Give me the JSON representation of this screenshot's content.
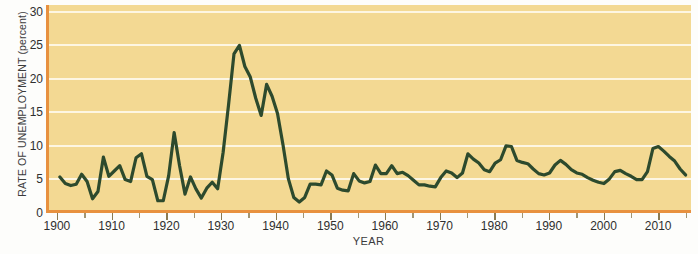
{
  "chart_data": {
    "type": "line",
    "title": "",
    "xlabel": "YEAR",
    "ylabel": "RATE OF UNEMPLOYMENT (percent)",
    "xlim": [
      1898,
      2016
    ],
    "ylim": [
      0,
      31
    ],
    "grid": "horizontal",
    "legend": "none",
    "line_color": "#2d4a2d",
    "plot_background": "#f3d993",
    "axis_color": "#e8913f",
    "gridline_color": "#fdf6e2",
    "y_ticks": [
      0,
      5,
      10,
      15,
      20,
      25,
      30
    ],
    "y_tick_labels": [
      "0",
      "5",
      "10",
      "15",
      "20",
      "25",
      "30"
    ],
    "x_ticks": [
      1900,
      1910,
      1920,
      1930,
      1940,
      1950,
      1960,
      1970,
      1980,
      1990,
      2000,
      2010
    ],
    "x_tick_labels": [
      "1900",
      "1910",
      "1920",
      "1930",
      "1940",
      "1950",
      "1960",
      "1970",
      "1980",
      "1990",
      "2000",
      "2010"
    ],
    "x_minor_ticks": [
      1905,
      1915,
      1925,
      1935,
      1945,
      1955,
      1965,
      1975,
      1985,
      1995,
      2005,
      2015
    ],
    "x": [
      1900,
      1901,
      1902,
      1903,
      1904,
      1905,
      1906,
      1907,
      1908,
      1909,
      1910,
      1911,
      1912,
      1913,
      1914,
      1915,
      1916,
      1917,
      1918,
      1919,
      1920,
      1921,
      1922,
      1923,
      1924,
      1925,
      1926,
      1927,
      1928,
      1929,
      1930,
      1931,
      1932,
      1933,
      1934,
      1935,
      1936,
      1937,
      1938,
      1939,
      1940,
      1941,
      1942,
      1943,
      1944,
      1945,
      1946,
      1947,
      1948,
      1949,
      1950,
      1951,
      1952,
      1953,
      1954,
      1955,
      1956,
      1957,
      1958,
      1959,
      1960,
      1961,
      1962,
      1963,
      1964,
      1965,
      1966,
      1967,
      1968,
      1969,
      1970,
      1971,
      1972,
      1973,
      1974,
      1975,
      1976,
      1977,
      1978,
      1979,
      1980,
      1981,
      1982,
      1983,
      1984,
      1985,
      1986,
      1987,
      1988,
      1989,
      1990,
      1991,
      1992,
      1993,
      1994,
      1995,
      1996,
      1997,
      1998,
      1999,
      2000,
      2001,
      2002,
      2003,
      2004,
      2005,
      2006,
      2007,
      2008,
      2009,
      2010,
      2011,
      2012,
      2013,
      2014,
      2015
    ],
    "values": [
      5.0,
      4.0,
      3.7,
      3.9,
      5.4,
      4.3,
      1.7,
      2.8,
      8.0,
      5.1,
      5.9,
      6.7,
      4.6,
      4.3,
      7.9,
      8.5,
      5.1,
      4.6,
      1.4,
      1.4,
      5.2,
      11.7,
      6.7,
      2.4,
      5.0,
      3.2,
      1.8,
      3.3,
      4.2,
      3.2,
      8.7,
      15.9,
      23.6,
      24.9,
      21.7,
      20.1,
      16.9,
      14.3,
      19.0,
      17.2,
      14.6,
      9.9,
      4.7,
      1.9,
      1.2,
      1.9,
      3.9,
      3.9,
      3.8,
      5.9,
      5.3,
      3.3,
      3.0,
      2.9,
      5.5,
      4.4,
      4.1,
      4.3,
      6.8,
      5.5,
      5.5,
      6.7,
      5.5,
      5.7,
      5.2,
      4.5,
      3.8,
      3.8,
      3.6,
      3.5,
      4.9,
      5.9,
      5.6,
      4.9,
      5.6,
      8.5,
      7.7,
      7.1,
      6.1,
      5.8,
      7.1,
      7.6,
      9.7,
      9.6,
      7.5,
      7.2,
      7.0,
      6.2,
      5.5,
      5.3,
      5.6,
      6.8,
      7.5,
      6.9,
      6.1,
      5.6,
      5.4,
      4.9,
      4.5,
      4.2,
      4.0,
      4.7,
      5.8,
      6.0,
      5.5,
      5.1,
      4.6,
      4.6,
      5.8,
      9.3,
      9.6,
      8.9,
      8.1,
      7.4,
      6.2,
      5.3
    ]
  }
}
